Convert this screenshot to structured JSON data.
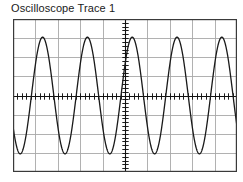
{
  "figure": {
    "title": "Oscilloscope Trace 1",
    "background_color": "#ffffff",
    "border_color": "#3a3a3a",
    "grid_color": "#a8a8a8",
    "trace_color": "#1a1a1a",
    "axis_color": "#111111"
  },
  "graticule": {
    "horizontal_divisions": 10,
    "vertical_divisions": 8,
    "center_axes": true,
    "axis_tick_marks_per_division": 5,
    "frame": {
      "x": 13,
      "y": 19,
      "width": 224,
      "height": 153
    }
  },
  "chart_data": {
    "type": "line",
    "title": "Oscilloscope Trace 1",
    "xlabel": "",
    "ylabel": "",
    "xlim": [
      -5,
      5
    ],
    "ylim": [
      -4,
      4
    ],
    "grid": true,
    "legend": "none",
    "series": [
      {
        "name": "Trace 1",
        "waveform": "sine",
        "amplitude_divisions": 3.05,
        "cycles_across_screen": 5,
        "period_divisions": 2,
        "phase_degrees": 212,
        "offset_divisions": 0,
        "color": "#1a1a1a",
        "x": [
          -5.0,
          -4.8,
          -4.6,
          -4.4,
          -4.2,
          -4.0,
          -3.8,
          -3.6,
          -3.4,
          -3.2,
          -3.0,
          -2.8,
          -2.6,
          -2.4,
          -2.2,
          -2.0,
          -1.8,
          -1.6,
          -1.4,
          -1.2,
          -1.0,
          -0.8,
          -0.6,
          -0.4,
          -0.2,
          0.0,
          0.2,
          0.4,
          0.6,
          0.8,
          1.0,
          1.2,
          1.4,
          1.6,
          1.8,
          2.0,
          2.2,
          2.4,
          2.6,
          2.8,
          3.0,
          3.2,
          3.4,
          3.6,
          3.8,
          4.0,
          4.2,
          4.4,
          4.6,
          4.8,
          5.0
        ],
        "y": [
          -2.59,
          -1.79,
          -0.63,
          0.63,
          1.79,
          2.59,
          2.9,
          2.64,
          1.88,
          0.76,
          -0.5,
          -1.7,
          -2.54,
          -2.9,
          -2.73,
          -2.06,
          -1.0,
          0.25,
          1.49,
          2.43,
          2.88,
          2.8,
          2.2,
          1.2,
          -0.06,
          -1.33,
          -2.32,
          -2.84,
          -2.85,
          -2.34,
          -1.38,
          -0.15,
          1.1,
          2.19,
          2.79,
          2.87,
          2.46,
          1.56,
          0.36,
          -0.89,
          -2.04,
          -2.73,
          -2.88,
          -2.57,
          -1.73,
          -0.56,
          0.69,
          1.84,
          2.62,
          2.9,
          2.61
        ],
        "data_points": 51
      }
    ]
  }
}
